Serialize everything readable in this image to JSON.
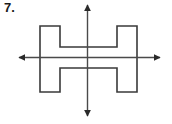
{
  "figure": {
    "problem_number": "7.",
    "canvas": {
      "width": 172,
      "height": 124,
      "background": "#ffffff"
    },
    "shape": {
      "name": "h-shape",
      "stroke_color": "#3a3a3a",
      "fill_color": "#ffffff",
      "stroke_width": 1.6,
      "bounds": {
        "left": 40,
        "top": 26,
        "right": 137,
        "bottom": 92
      },
      "left_bar": {
        "left": 40,
        "right": 60
      },
      "right_bar": {
        "left": 117,
        "right": 137
      },
      "crossbar": {
        "top": 47,
        "bottom": 68
      },
      "points": "40,26 60,26 60,47 117,47 117,26 137,26 137,92 117,92 117,68 60,68 60,92 40,92"
    },
    "axes": {
      "center": {
        "x": 87.5,
        "y": 57.5
      },
      "stroke_color": "#4a4a4a",
      "stroke_width": 1.4,
      "horizontal": {
        "name": "horizontal-symmetry-axis",
        "x1": 19,
        "x2": 160,
        "y": 57.5,
        "arrowheads": [
          "left",
          "right"
        ]
      },
      "vertical": {
        "name": "vertical-symmetry-axis",
        "y1": 5,
        "y2": 116,
        "x": 87.5,
        "arrowheads": [
          "up",
          "down"
        ]
      }
    }
  }
}
